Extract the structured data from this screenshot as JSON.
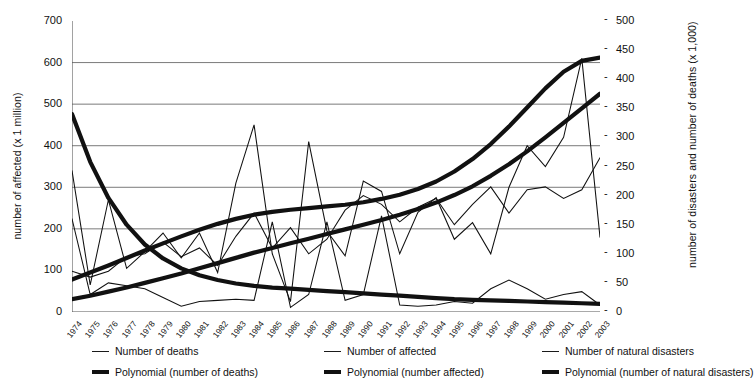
{
  "axes": {
    "left_title": "number of affected (x 1 million)",
    "right_title": "number of disasters and number of deaths (x 1,000)",
    "left_ticks": [
      "700",
      "600",
      "500",
      "400",
      "300",
      "200",
      "100",
      "0"
    ],
    "right_ticks": [
      "500",
      "450",
      "400",
      "350",
      "300",
      "250",
      "200",
      "150",
      "100",
      "50",
      "0"
    ],
    "tick_dash": "-"
  },
  "legend": {
    "items": [
      {
        "label": "Number of deaths",
        "style": "thin"
      },
      {
        "label": "Number of affected",
        "style": "thin"
      },
      {
        "label": "Number of natural disasters",
        "style": "thin"
      },
      {
        "label": "Polynomial (number of deaths)",
        "style": "thick"
      },
      {
        "label": "Polynomial (number affected)",
        "style": "thick"
      },
      {
        "label": "Polynomial (number of natural disasters)",
        "style": "thick"
      }
    ]
  },
  "chart_data": {
    "type": "line",
    "title": "",
    "xlabel": "",
    "ylabel": "number of affected (x 1 million)",
    "y2label": "number of disasters and number of deaths (x 1,000)",
    "ylim": [
      0,
      700
    ],
    "y2lim": [
      0,
      500
    ],
    "grid": true,
    "gridlines_left": [
      200,
      300,
      400,
      500,
      600
    ],
    "legend_position": "bottom",
    "categories": [
      "1974",
      "1975",
      "1976",
      "1977",
      "1978",
      "1979",
      "1980",
      "1981",
      "1982",
      "1983",
      "1984",
      "1985",
      "1986",
      "1987",
      "1988",
      "1989",
      "1990",
      "1991",
      "1992",
      "1993",
      "1994",
      "1995",
      "1996",
      "1997",
      "1998",
      "1999",
      "2000",
      "2001",
      "2002",
      "2003"
    ],
    "series": [
      {
        "name": "Number of affected",
        "axis": "left",
        "style": "thin",
        "units": "x 1 million",
        "values": [
          340,
          65,
          270,
          105,
          145,
          190,
          130,
          190,
          95,
          310,
          450,
          140,
          25,
          410,
          195,
          135,
          315,
          290,
          140,
          240,
          275,
          175,
          215,
          140,
          300,
          400,
          350,
          420,
          610,
          180
        ]
      },
      {
        "name": "Number of deaths",
        "axis": "right",
        "style": "thin",
        "units": "x 1,000",
        "values": [
          160,
          30,
          50,
          45,
          40,
          25,
          10,
          18,
          20,
          22,
          20,
          155,
          8,
          30,
          155,
          20,
          30,
          165,
          12,
          10,
          12,
          18,
          15,
          40,
          55,
          40,
          22,
          30,
          35,
          12
        ]
      },
      {
        "name": "Number of natural disasters",
        "axis": "right",
        "style": "thin",
        "units": "count",
        "values": [
          70,
          60,
          70,
          95,
          100,
          120,
          95,
          110,
          80,
          130,
          170,
          110,
          145,
          100,
          125,
          175,
          200,
          185,
          155,
          180,
          195,
          150,
          185,
          215,
          170,
          210,
          215,
          195,
          210,
          265
        ]
      },
      {
        "name": "Polynomial (number affected)",
        "axis": "left",
        "style": "thick",
        "trend": "polynomial",
        "values": [
          78,
          95,
          112,
          130,
          148,
          165,
          182,
          198,
          212,
          224,
          234,
          241,
          246,
          250,
          254,
          258,
          264,
          272,
          282,
          296,
          314,
          338,
          368,
          404,
          446,
          492,
          538,
          578,
          604,
          612
        ]
      },
      {
        "name": "Polynomial (number of deaths)",
        "axis": "right",
        "style": "thick",
        "trend": "polynomial",
        "values": [
          340,
          258,
          196,
          150,
          116,
          92,
          75,
          63,
          55,
          49,
          45,
          42,
          40,
          38,
          36,
          34,
          32,
          30,
          28,
          26,
          24,
          22,
          21,
          20,
          19,
          18,
          17,
          16,
          15,
          14
        ]
      },
      {
        "name": "Polynomial (number of natural disasters)",
        "axis": "right",
        "style": "thick",
        "trend": "polynomial",
        "values": [
          22,
          28,
          35,
          42,
          50,
          58,
          66,
          75,
          84,
          93,
          102,
          110,
          118,
          126,
          134,
          142,
          150,
          158,
          167,
          177,
          188,
          201,
          216,
          234,
          254,
          276,
          300,
          325,
          350,
          375
        ]
      }
    ]
  }
}
